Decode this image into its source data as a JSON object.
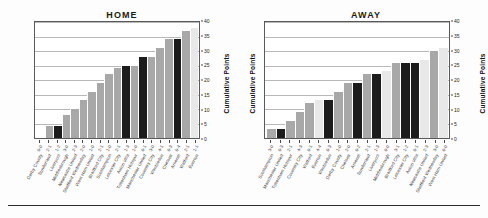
{
  "figure": {
    "footer_rule": true
  },
  "chart_data": [
    {
      "type": "bar",
      "title": "HOME",
      "xlabel": "",
      "ylabel": "Cumulative Points",
      "ylim": [
        0,
        40
      ],
      "yticks": [
        0,
        5,
        10,
        15,
        20,
        25,
        30,
        35,
        40
      ],
      "grid": true,
      "legend": "none",
      "categories": [
        "Derby County",
        "Sunderland",
        "Liverpool",
        "Middlesbrough",
        "Newcastle United",
        "Sheffield Wednesday",
        "West Ham United",
        "Bradford City",
        "Southampton",
        "Leicester City",
        "Aston Villa",
        "Tottenham Hotspur",
        "Manchester United",
        "Coventry City",
        "Wimbledon",
        "Chelsea",
        "Arsenal",
        "Watford",
        "Everton"
      ],
      "scores": [
        "0-0",
        "2-1",
        "1-2",
        "3-0",
        "2-3",
        "2-0",
        "1-0",
        "2-1",
        "1-0",
        "2-1",
        "1-3",
        "1-0",
        "0-1",
        "3-0",
        "4-1",
        "0-3",
        "0-4",
        "2-1",
        "1-1"
      ],
      "values": [
        0,
        4,
        4,
        8,
        10,
        13,
        16,
        19,
        22,
        24,
        25,
        25,
        28,
        28,
        31,
        34,
        34,
        37,
        38
      ],
      "bar_shades": [
        "light",
        "mid",
        "dark",
        "mid",
        "mid",
        "mid",
        "mid",
        "mid",
        "mid",
        "mid",
        "dark",
        "mid",
        "dark",
        "mid",
        "mid",
        "mid",
        "dark",
        "mid",
        "light"
      ]
    },
    {
      "type": "bar",
      "title": "AWAY",
      "xlabel": "",
      "ylabel": "Cumulative Points",
      "ylim": [
        0,
        40
      ],
      "yticks": [
        0,
        5,
        10,
        15,
        20,
        25,
        30,
        35,
        40
      ],
      "grid": true,
      "legend": "none",
      "categories": [
        "Southampton",
        "Manchester United",
        "Tottenham Hotspur",
        "Coventry City",
        "Watford",
        "Everton",
        "Wimbledon",
        "Derby County",
        "Chelsea",
        "Arsenal",
        "Sunderland",
        "Liverpool",
        "Middlesbrough",
        "Bradford City",
        "Leicester City",
        "Aston Villa",
        "Newcastle United",
        "Sheffield Wednesday",
        "West Ham United"
      ],
      "scores": [
        "3-0",
        "0-3",
        "2-1",
        "4-3",
        "0-1",
        "4-4",
        "0-3",
        "1-0",
        "2-0",
        "0-2",
        "2-1",
        "1-3",
        "0-0",
        "3-1",
        "1-2",
        "0-1",
        "2-3",
        "3-0",
        "0-0"
      ],
      "values": [
        3,
        3,
        6,
        9,
        12,
        13,
        13,
        16,
        19,
        19,
        22,
        22,
        23,
        26,
        26,
        26,
        27,
        30,
        31
      ],
      "bar_shades": [
        "mid",
        "dark",
        "mid",
        "mid",
        "mid",
        "light",
        "dark",
        "mid",
        "mid",
        "dark",
        "mid",
        "dark",
        "light",
        "mid",
        "dark",
        "dark",
        "light",
        "mid",
        "light"
      ]
    }
  ],
  "colors": {
    "bar_light": "#e8e8e8",
    "bar_mid": "#a8a8a8",
    "bar_dark": "#1c1c1c",
    "grid": "#b9b9b9",
    "axis": "#5a5a5a",
    "text": "#1a1a1a"
  }
}
